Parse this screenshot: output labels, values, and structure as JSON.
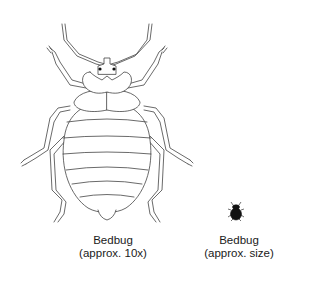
{
  "figure": {
    "large": {
      "label": "Bedbug",
      "scale": "(approx. 10x)",
      "style": "line-drawing"
    },
    "small": {
      "label": "Bedbug",
      "scale": "(approx. size)",
      "style": "silhouette"
    },
    "colors": {
      "line": "#444444",
      "fill": "#111111",
      "background": "#ffffff"
    }
  }
}
